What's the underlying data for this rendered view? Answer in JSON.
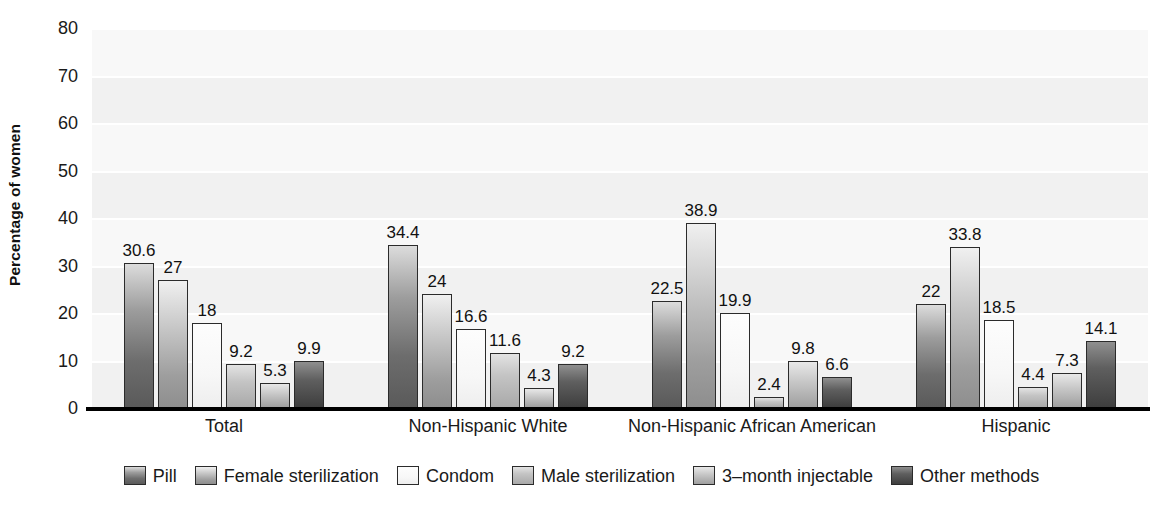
{
  "chart_data": {
    "type": "bar",
    "title": "",
    "xlabel": "",
    "ylabel": "Percentage of women",
    "ylim": [
      0,
      80
    ],
    "yticks": [
      0,
      10,
      20,
      30,
      40,
      50,
      60,
      70,
      80
    ],
    "ytick_labels": [
      "0",
      "10",
      "20",
      "30",
      "40",
      "50",
      "60",
      "70",
      "80"
    ],
    "grid": true,
    "legend_position": "bottom",
    "categories": [
      "Total",
      "Non-Hispanic White",
      "Non-Hispanic African American",
      "Hispanic"
    ],
    "series": [
      {
        "name": "Pill",
        "color": "#6d6d6d",
        "values": [
          30.6,
          34.4,
          22.5,
          22.0
        ],
        "labels": [
          "30.6",
          "34.4",
          "22.5",
          "22"
        ]
      },
      {
        "name": "Female sterilization",
        "color": "#9e9e9e",
        "values": [
          27.0,
          24.0,
          38.9,
          33.8
        ],
        "labels": [
          "27",
          "24",
          "38.9",
          "33.8"
        ]
      },
      {
        "name": "Condom",
        "color": "#f5f5f5",
        "values": [
          18.0,
          16.6,
          19.9,
          18.5
        ],
        "labels": [
          "18",
          "16.6",
          "19.9",
          "18.5"
        ]
      },
      {
        "name": "Male sterilization",
        "color": "#b5b5b5",
        "values": [
          9.2,
          11.6,
          2.4,
          4.4
        ],
        "labels": [
          "9.2",
          "11.6",
          "2.4",
          "4.4"
        ]
      },
      {
        "name": "3–month injectable",
        "color": "#ababab",
        "values": [
          5.3,
          4.3,
          9.8,
          7.3
        ],
        "labels": [
          "5.3",
          "4.3",
          "9.8",
          "7.3"
        ]
      },
      {
        "name": "Other methods",
        "color": "#454545",
        "values": [
          9.9,
          9.2,
          6.6,
          14.1
        ],
        "labels": [
          "9.9",
          "9.2",
          "6.6",
          "14.1"
        ]
      }
    ]
  }
}
